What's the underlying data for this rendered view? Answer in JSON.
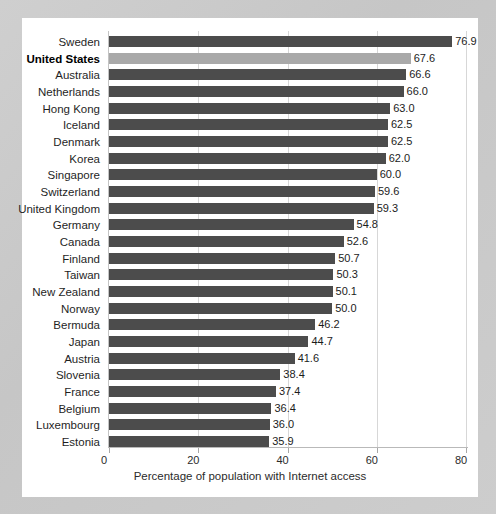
{
  "chart_data": {
    "type": "bar",
    "orientation": "horizontal",
    "title": "",
    "xlabel": "Percentage of population with Internet access",
    "ylabel": "",
    "xlim": [
      0,
      80
    ],
    "xticks": [
      0,
      20,
      40,
      60,
      80
    ],
    "xtick_labels": [
      "0",
      "20",
      "40",
      "60",
      "80"
    ],
    "grid": "vertical",
    "legend": "none",
    "highlight_category": "United States",
    "colors": {
      "bar": "#4c4c4c",
      "bar_highlight": "#a9a9a9",
      "card_background": "#ffffff",
      "page_background": "#c9c9c9",
      "gridline": "#d7d7d7",
      "axis": "#b9b9b9",
      "text": "#1f1f1f"
    },
    "categories": [
      "Sweden",
      "United States",
      "Australia",
      "Netherlands",
      "Hong Kong",
      "Iceland",
      "Denmark",
      "Korea",
      "Singapore",
      "Switzerland",
      "United Kingdom",
      "Germany",
      "Canada",
      "Finland",
      "Taiwan",
      "New Zealand",
      "Norway",
      "Bermuda",
      "Japan",
      "Austria",
      "Slovenia",
      "France",
      "Belgium",
      "Luxembourg",
      "Estonia"
    ],
    "values": [
      76.9,
      67.6,
      66.6,
      66.0,
      63.0,
      62.5,
      62.5,
      62.0,
      60.0,
      59.6,
      59.3,
      54.8,
      52.6,
      50.7,
      50.3,
      50.1,
      50.0,
      46.2,
      44.7,
      41.6,
      38.4,
      37.4,
      36.4,
      36.0,
      35.9
    ],
    "value_labels": [
      "76.9",
      "67.6",
      "66.6",
      "66.0",
      "63.0",
      "62.5",
      "62.5",
      "62.0",
      "60.0",
      "59.6",
      "59.3",
      "54.8",
      "52.6",
      "50.7",
      "50.3",
      "50.1",
      "50.0",
      "46.2",
      "44.7",
      "41.6",
      "38.4",
      "37.4",
      "36.4",
      "36.0",
      "35.9"
    ]
  }
}
